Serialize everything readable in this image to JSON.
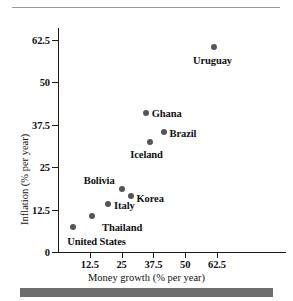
{
  "figure": {
    "top_rule": "horizontal-rule",
    "bottom_bar": "solid-gray-bar"
  },
  "chart_data": {
    "type": "scatter",
    "title": "",
    "xlabel": "Money growth (% per year)",
    "ylabel": "Inflation (% per year)",
    "xlim": [
      0,
      68
    ],
    "ylim": [
      0,
      66
    ],
    "xticks": [
      12.5,
      25,
      37.5,
      50,
      62.5
    ],
    "xtick_labels": [
      "12.5",
      "25",
      "37.5",
      "50",
      "62.5"
    ],
    "yticks": [
      0,
      12.5,
      25,
      37.5,
      50,
      62.5
    ],
    "ytick_labels": [
      "0",
      "12.5",
      "25",
      "37.5",
      "50",
      "62.5"
    ],
    "grid": false,
    "legend": "none",
    "marker_color": "#555555",
    "points": [
      {
        "label": "United States",
        "x": 6.0,
        "y": 7.5,
        "label_dx": -6,
        "label_dy": 14,
        "label_align": "left"
      },
      {
        "label": "Thailand",
        "x": 13.4,
        "y": 10.6,
        "label_dx": 10,
        "label_dy": 11,
        "label_align": "left"
      },
      {
        "label": "Italy",
        "x": 19.7,
        "y": 14.2,
        "label_dx": 6,
        "label_dy": 1,
        "label_align": "left"
      },
      {
        "label": "Bolivia",
        "x": 25.0,
        "y": 18.5,
        "label_dx": -7,
        "label_dy": -9,
        "label_align": "right"
      },
      {
        "label": "Korea",
        "x": 28.5,
        "y": 16.5,
        "label_dx": 6,
        "label_dy": 2,
        "label_align": "left"
      },
      {
        "label": "Iceland",
        "x": 36.0,
        "y": 32.5,
        "label_dx": -3,
        "label_dy": 12,
        "label_align": "center"
      },
      {
        "label": "Ghana",
        "x": 34.5,
        "y": 41.0,
        "label_dx": 6,
        "label_dy": 0,
        "label_align": "left"
      },
      {
        "label": "Brazil",
        "x": 41.5,
        "y": 35.5,
        "label_dx": 6,
        "label_dy": 1,
        "label_align": "left"
      },
      {
        "label": "Uruguay",
        "x": 61.5,
        "y": 60.5,
        "label_dx": -2,
        "label_dy": 13,
        "label_align": "center"
      }
    ]
  }
}
